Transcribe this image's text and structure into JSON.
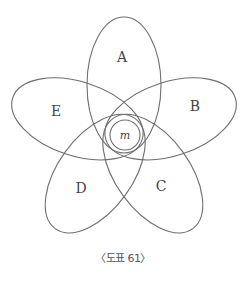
{
  "diagram": {
    "type": "five-set flower Venn diagram",
    "pivot": {
      "cx": 124,
      "cy": 134
    },
    "petals": [
      {
        "id": "A",
        "label": "A",
        "angle": 0,
        "label_pos": {
          "x": 122,
          "y": 57
        }
      },
      {
        "id": "B",
        "label": "B",
        "angle": 72,
        "label_pos": {
          "x": 195,
          "y": 106
        }
      },
      {
        "id": "C",
        "label": "C",
        "angle": 144,
        "label_pos": {
          "x": 161,
          "y": 186
        }
      },
      {
        "id": "D",
        "label": "D",
        "angle": 216,
        "label_pos": {
          "x": 81,
          "y": 188
        }
      },
      {
        "id": "E",
        "label": "E",
        "angle": 288,
        "label_pos": {
          "x": 56,
          "y": 111
        }
      }
    ],
    "petal_shape": {
      "offset": 49,
      "rx": 37,
      "ry": 68
    },
    "center": {
      "label": "m",
      "cx": 125,
      "cy": 135,
      "r": 15
    },
    "stroke_color": "#6e6e6e"
  },
  "caption": "〈도표 61〉"
}
